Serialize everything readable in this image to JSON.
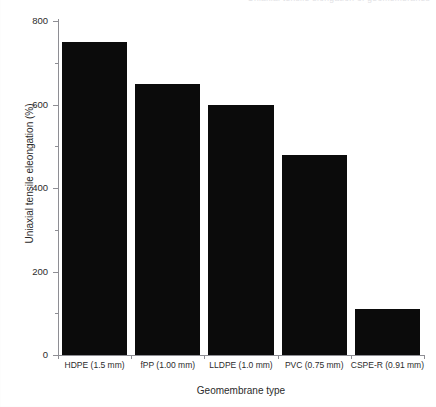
{
  "top_caption": "Uniaxial tensile elongation of geomembranes",
  "chart_data": {
    "type": "bar",
    "title": "",
    "xlabel": "Geomembrane type",
    "ylabel": "Uniaxial tensile eleongation (%)",
    "categories": [
      "HDPE (1.5 mm)",
      "fPP (1.00 mm)",
      "LLDPE (1.0 mm)",
      "PVC (0.75 mm)",
      "CSPE-R (0.91 mm)"
    ],
    "values": [
      750,
      650,
      600,
      480,
      110
    ],
    "ylim": [
      0,
      800
    ],
    "yticks": [
      0,
      200,
      400,
      600,
      800
    ],
    "ytick_labels": [
      "0",
      "200",
      "400",
      "600",
      "800"
    ],
    "yminor_ticks": [
      100,
      300,
      500,
      700
    ],
    "grid": false,
    "legend": false,
    "bar_color": "#0b0b0b",
    "axis_color": "#8e8e94"
  }
}
